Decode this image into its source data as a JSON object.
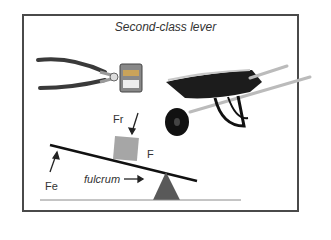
{
  "title": "Second-class lever",
  "labels": {
    "resistance_force": "Fr",
    "effort_force": "Fe",
    "force": "F",
    "fulcrum": "fulcrum"
  },
  "illustrations": [
    "pliers",
    "wheelbarrow"
  ],
  "colors": {
    "frame": "#4a4a4a",
    "lever_bar": "#111111",
    "load_block": "#a6a6a6",
    "fulcrum_triangle": "#595959",
    "ground_line": "#8a8a8a"
  }
}
